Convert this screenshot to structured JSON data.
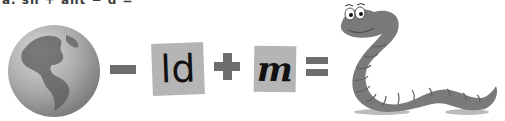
{
  "puzzle": {
    "top_text": "a. sn + ant − d =",
    "operators": {
      "minus": "−",
      "plus": "+",
      "equals": "="
    },
    "cards": [
      {
        "text": "ld"
      },
      {
        "text": "m"
      }
    ],
    "images": {
      "left": "globe-earth-icon",
      "right": "worm-cartoon-icon"
    },
    "colors": {
      "operator": "#6e6e6e",
      "card_bg": "#b5b5b5",
      "globe": "#8a8a8a",
      "worm": "#7a7a7a"
    }
  }
}
